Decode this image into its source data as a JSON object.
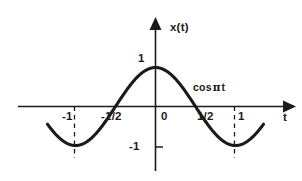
{
  "figure": {
    "name": "cosine-waveform-plot",
    "background_color": "#ffffff",
    "ink_color": "#1a1a1a"
  },
  "axes": {
    "vertical_label": "x(t)",
    "horizontal_label": "t",
    "origin_label": "0",
    "x_ticks": [
      {
        "value": -1,
        "label": "-1",
        "dashed_guide": true
      },
      {
        "value": -0.5,
        "label": "-1/2",
        "dashed_guide": false
      },
      {
        "value": 0.5,
        "label": "1/2",
        "dashed_guide": false
      },
      {
        "value": 1,
        "label": "1",
        "dashed_guide": true
      }
    ],
    "y_ticks": [
      {
        "value": 1,
        "label": "1",
        "tick_mark": false
      },
      {
        "value": -1,
        "label": "-1",
        "tick_mark": true
      }
    ],
    "x_range": [
      -1.42,
      1.7
    ],
    "y_range": [
      -1.42,
      1.72
    ],
    "arrowheads": [
      "x-positive",
      "y-positive"
    ],
    "grid": false
  },
  "annotations": [
    {
      "name": "curve-equation-label",
      "text_prefix": "cos",
      "symbol": "π",
      "text_suffix": "t",
      "t": 0.52,
      "x": 0.55
    }
  ],
  "chart_data": {
    "type": "line",
    "title": "",
    "xlabel": "t",
    "ylabel": "x(t)",
    "xlim": [
      -1.42,
      1.7
    ],
    "ylim": [
      -1.42,
      1.72
    ],
    "grid": false,
    "legend": null,
    "series": [
      {
        "name": "cos πt",
        "equation": "cos(πt)",
        "x": [
          -1.35,
          -1.3,
          -1.2,
          -1.1,
          -1.0,
          -0.9,
          -0.8,
          -0.7,
          -0.6,
          -0.5,
          -0.4,
          -0.3,
          -0.2,
          -0.1,
          0.0,
          0.1,
          0.2,
          0.3,
          0.4,
          0.5,
          0.6,
          0.7,
          0.8,
          0.9,
          1.0,
          1.1,
          1.2,
          1.3,
          1.35
        ],
        "y": [
          -0.891,
          -0.891,
          -0.951,
          -0.951,
          -1.0,
          -0.951,
          -0.809,
          -0.588,
          -0.309,
          0.0,
          0.309,
          0.588,
          0.809,
          0.951,
          1.0,
          0.951,
          0.809,
          0.588,
          0.309,
          0.0,
          -0.309,
          -0.588,
          -0.809,
          -0.951,
          -1.0,
          -0.951,
          -0.809,
          -0.891,
          -0.891
        ]
      }
    ],
    "key_points": [
      {
        "t": -1,
        "x": -1,
        "note": "minimum"
      },
      {
        "t": -0.5,
        "x": 0,
        "note": "zero crossing"
      },
      {
        "t": 0,
        "x": 1,
        "note": "maximum"
      },
      {
        "t": 0.5,
        "x": 0,
        "note": "zero crossing"
      },
      {
        "t": 1,
        "x": -1,
        "note": "minimum"
      }
    ]
  }
}
